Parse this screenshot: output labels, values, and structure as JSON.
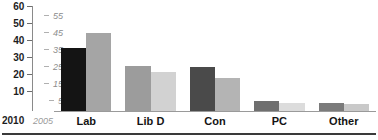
{
  "chart_data": {
    "type": "bar",
    "title": "",
    "subtitle": "",
    "xlabel": "",
    "ylabel": "",
    "grid": false,
    "legend_position": "axis-labels-bottom-left",
    "categories": [
      "Lab",
      "Lib D",
      "Con",
      "PC",
      "Other"
    ],
    "series": [
      {
        "name": "2010",
        "axis": "primary",
        "color": "#9c9c9c",
        "values": [
          37,
          26.5,
          26,
          6,
          5
        ],
        "bar_colors": [
          "#141414",
          "#9c9c9c",
          "#4a4a4a",
          "#6f6f6f",
          "#7b7b7b"
        ]
      },
      {
        "name": "2005",
        "axis": "secondary",
        "color": "#c8c8c8",
        "values": [
          46,
          23,
          19.5,
          5,
          4
        ],
        "bar_colors": [
          "#a5a5a5",
          "#d2d2d2",
          "#b4b4b4",
          "#dcdcdc",
          "#c9c9c9"
        ]
      }
    ],
    "primary_axis": {
      "name": "2010",
      "ticks": [
        60,
        50,
        40,
        30,
        20,
        10
      ],
      "ylim": [
        0,
        62
      ],
      "style": "bold-dark"
    },
    "secondary_axis": {
      "name": "2005",
      "ticks": [
        55,
        45,
        35,
        25,
        15,
        5
      ],
      "ylim": [
        0,
        62
      ],
      "style": "italic-gray"
    }
  },
  "colors": {
    "axis_primary_text": "#1d1d1d",
    "axis_secondary_text": "#8c8c8c",
    "baseline": "#9a9a9a",
    "bottom_rule": "#3a3a3a",
    "category_label": "#141414"
  }
}
